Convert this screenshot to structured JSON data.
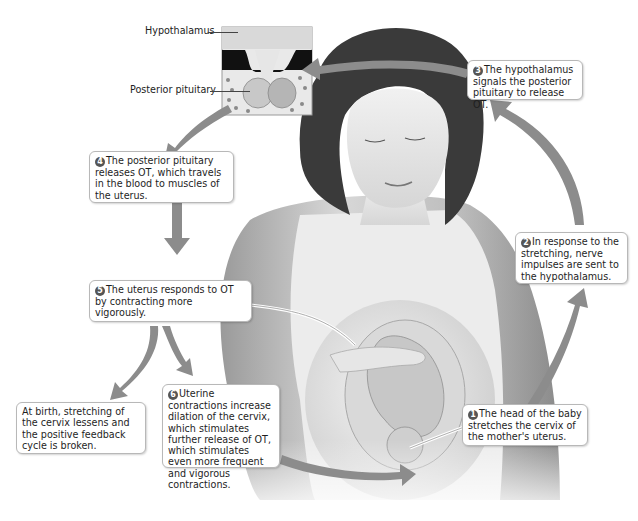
{
  "diagram": {
    "inset_labels": {
      "hypothalamus": "Hypothalamus",
      "posterior_pituitary": "Posterior pituitary"
    },
    "steps": [
      {
        "number": "1",
        "text": "The head of the baby stretches the cervix of the mother's uterus."
      },
      {
        "number": "2",
        "text": "In response to the stretching, nerve impulses are sent to the hypothalamus."
      },
      {
        "number": "3",
        "text": "The hypothalamus signals the posterior pituitary to release OT."
      },
      {
        "number": "4",
        "text": "The posterior pituitary releases OT, which travels in the blood to muscles of the uterus."
      },
      {
        "number": "5",
        "text": "The uterus responds to OT by contracting more vigorously."
      },
      {
        "number": "6",
        "text": "Uterine contractions increase dilation of the cervix, which stimulates further release of OT, which stimulates even more frequent and vigorous contractions."
      }
    ],
    "exit_note": "At birth, stretching of the cervix lessens and the positive feedback cycle is broken.",
    "colors": {
      "arrow": "#8c8c8c",
      "box_border": "#b8b8b8",
      "number_badge": "#555555",
      "background": "#ffffff"
    }
  }
}
